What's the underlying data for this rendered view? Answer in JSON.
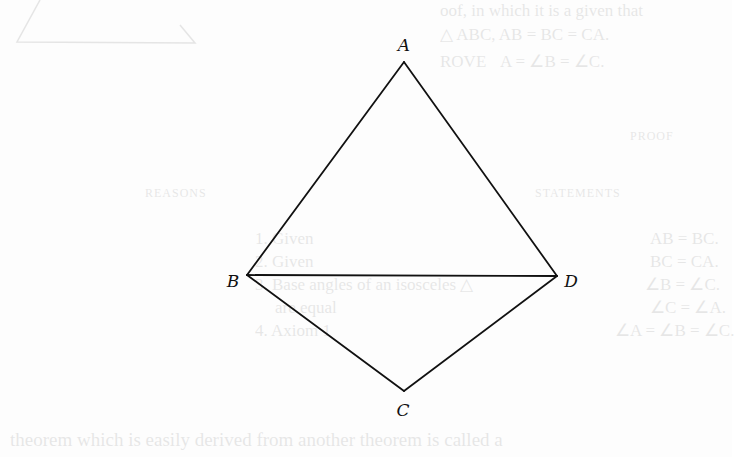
{
  "diagram": {
    "stroke_color": "#111111",
    "background_color": "#fdfdfd",
    "vertices": [
      {
        "name": "A",
        "label": "A",
        "x": 404,
        "y": 62,
        "label_x": 404,
        "label_y": 45
      },
      {
        "name": "B",
        "label": "B",
        "x": 247,
        "y": 275,
        "label_x": 233,
        "label_y": 281
      },
      {
        "name": "D",
        "label": "D",
        "x": 557,
        "y": 276,
        "label_x": 571,
        "label_y": 281
      },
      {
        "name": "C",
        "label": "C",
        "x": 404,
        "y": 391,
        "label_x": 403,
        "label_y": 410
      }
    ],
    "segments": [
      {
        "from": "A",
        "to": "B"
      },
      {
        "from": "A",
        "to": "D"
      },
      {
        "from": "B",
        "to": "D"
      },
      {
        "from": "B",
        "to": "C"
      },
      {
        "from": "C",
        "to": "D"
      }
    ]
  },
  "show_through_text": {
    "header_lines": [
      "oof, in which it is a given that",
      "△ ABC, AB = BC = CA.",
      "ROVE",
      "A = ∠B = ∠C."
    ],
    "proof_heading": "PROOF",
    "statements_heading": "STATEMENTS",
    "reasons_heading": "REASONS",
    "statements": [
      "AB = BC.",
      "BC = CA.",
      "∠B = ∠C.",
      "∠C = ∠A.",
      "∠A = ∠B = ∠C."
    ],
    "reasons": [
      "1. Given",
      "2. Given",
      "3. Base angles of an isosceles △",
      "are equal",
      "4. Axiom 1"
    ],
    "footer_line": "theorem which is easily derived from another theorem is called a"
  }
}
